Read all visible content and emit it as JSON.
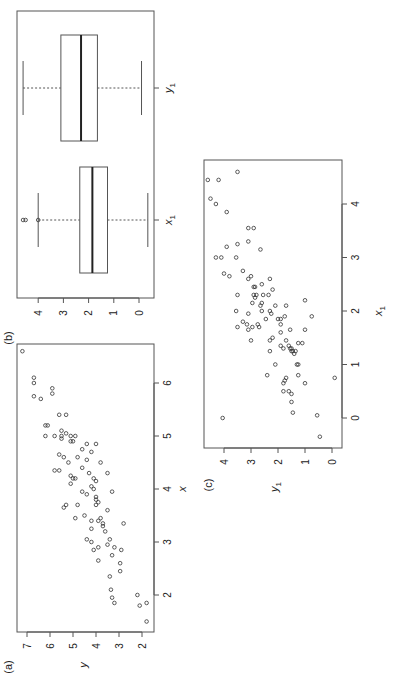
{
  "chart_data": [
    {
      "panel_label": "(a)",
      "type": "scatter",
      "title": "",
      "xlabel": "x",
      "ylabel": "y",
      "xticks": [
        2,
        3,
        4,
        5,
        6
      ],
      "yticks": [
        2,
        3,
        4,
        5,
        6,
        7
      ],
      "xlim": [
        1.5,
        6.7
      ],
      "ylim": [
        1.7,
        7.3
      ],
      "orientation": "rotated 90 degrees counter-clockwise",
      "points": [
        [
          6.6,
          7.2
        ],
        [
          6.1,
          6.7
        ],
        [
          6.0,
          6.7
        ],
        [
          5.9,
          5.9
        ],
        [
          5.8,
          5.9
        ],
        [
          5.75,
          6.7
        ],
        [
          5.7,
          6.4
        ],
        [
          5.4,
          5.6
        ],
        [
          5.4,
          5.3
        ],
        [
          5.2,
          6.1
        ],
        [
          5.2,
          6.2
        ],
        [
          5.1,
          5.5
        ],
        [
          5.05,
          5.3
        ],
        [
          5.0,
          5.5
        ],
        [
          5.0,
          6.2
        ],
        [
          5.0,
          5.8
        ],
        [
          5.0,
          5.1
        ],
        [
          5.0,
          4.9
        ],
        [
          4.95,
          5.5
        ],
        [
          4.9,
          5.1
        ],
        [
          4.9,
          5.0
        ],
        [
          4.85,
          4.4
        ],
        [
          4.85,
          4.0
        ],
        [
          4.75,
          4.6
        ],
        [
          4.7,
          4.2
        ],
        [
          4.65,
          5.6
        ],
        [
          4.6,
          5.4
        ],
        [
          4.6,
          4.8
        ],
        [
          4.55,
          4.4
        ],
        [
          4.5,
          5.2
        ],
        [
          4.5,
          3.8
        ],
        [
          4.4,
          4.6
        ],
        [
          4.35,
          5.8
        ],
        [
          4.35,
          5.6
        ],
        [
          4.3,
          4.3
        ],
        [
          4.3,
          3.5
        ],
        [
          4.25,
          5.1
        ],
        [
          4.2,
          5.0
        ],
        [
          4.2,
          4.9
        ],
        [
          4.2,
          4.1
        ],
        [
          4.15,
          4.0
        ],
        [
          4.1,
          5.1
        ],
        [
          4.05,
          4.2
        ],
        [
          4.0,
          4.1
        ],
        [
          3.95,
          4.6
        ],
        [
          3.95,
          3.3
        ],
        [
          3.9,
          4.4
        ],
        [
          3.85,
          4.0
        ],
        [
          3.8,
          4.0
        ],
        [
          3.75,
          3.9
        ],
        [
          3.7,
          5.3
        ],
        [
          3.7,
          4.8
        ],
        [
          3.7,
          4.0
        ],
        [
          3.65,
          5.4
        ],
        [
          3.6,
          3.5
        ],
        [
          3.5,
          4.5
        ],
        [
          3.45,
          4.9
        ],
        [
          3.45,
          3.8
        ],
        [
          3.4,
          4.2
        ],
        [
          3.4,
          3.9
        ],
        [
          3.35,
          3.7
        ],
        [
          3.35,
          2.8
        ],
        [
          3.3,
          3.7
        ],
        [
          3.25,
          4.2
        ],
        [
          3.2,
          3.6
        ],
        [
          3.05,
          4.4
        ],
        [
          3.05,
          3.4
        ],
        [
          3.0,
          4.2
        ],
        [
          2.95,
          3.5
        ],
        [
          2.9,
          3.9
        ],
        [
          2.9,
          3.2
        ],
        [
          2.85,
          4.1
        ],
        [
          2.85,
          2.9
        ],
        [
          2.75,
          3.3
        ],
        [
          2.65,
          3.9
        ],
        [
          2.6,
          2.95
        ],
        [
          2.45,
          2.95
        ],
        [
          2.35,
          3.4
        ],
        [
          2.1,
          3.35
        ],
        [
          1.95,
          3.3
        ],
        [
          1.85,
          3.2
        ],
        [
          2.0,
          2.2
        ],
        [
          1.8,
          2.1
        ],
        [
          1.85,
          1.8
        ],
        [
          1.5,
          1.8
        ]
      ]
    },
    {
      "panel_label": "(b)",
      "type": "boxplot",
      "title": "",
      "categories": [
        "x1",
        "y1"
      ],
      "yticks": [
        0,
        1,
        2,
        3,
        4
      ],
      "ylim": [
        -0.55,
        5.0
      ],
      "orientation": "rotated 90 degrees counter-clockwise",
      "series": [
        {
          "name": "x1",
          "whisker_low": -0.35,
          "q1": 1.25,
          "median": 1.85,
          "q3": 2.35,
          "whisker_high": 4.0,
          "outliers": [
            4.0,
            4.5,
            4.6
          ]
        },
        {
          "name": "y1",
          "whisker_low": -0.1,
          "q1": 1.65,
          "median": 2.3,
          "q3": 3.1,
          "whisker_high": 4.6,
          "outliers": []
        }
      ]
    },
    {
      "panel_label": "(c)",
      "type": "scatter",
      "title": "",
      "xlabel": "x1",
      "ylabel": "y1",
      "xticks": [
        0,
        1,
        2,
        3,
        4
      ],
      "yticks": [
        0,
        1,
        2,
        3,
        4
      ],
      "xlim": [
        -0.55,
        4.8
      ],
      "ylim": [
        -0.2,
        4.7
      ],
      "orientation": "rotated 90 degrees counter-clockwise",
      "points": [
        [
          4.6,
          3.5
        ],
        [
          4.45,
          4.6
        ],
        [
          4.45,
          4.2
        ],
        [
          4.1,
          4.5
        ],
        [
          4.0,
          4.3
        ],
        [
          3.85,
          3.9
        ],
        [
          3.55,
          3.1
        ],
        [
          3.55,
          2.9
        ],
        [
          3.3,
          3.1
        ],
        [
          3.25,
          3.5
        ],
        [
          3.2,
          3.9
        ],
        [
          3.15,
          2.65
        ],
        [
          3.0,
          4.3
        ],
        [
          3.0,
          4.1
        ],
        [
          3.0,
          3.55
        ],
        [
          2.75,
          3.3
        ],
        [
          2.7,
          4.0
        ],
        [
          2.65,
          3.8
        ],
        [
          2.65,
          3.0
        ],
        [
          2.6,
          3.1
        ],
        [
          2.6,
          2.3
        ],
        [
          2.5,
          2.6
        ],
        [
          2.45,
          2.9
        ],
        [
          2.45,
          2.85
        ],
        [
          2.4,
          2.2
        ],
        [
          2.3,
          2.9
        ],
        [
          2.3,
          2.8
        ],
        [
          2.3,
          2.55
        ],
        [
          2.3,
          2.35
        ],
        [
          2.3,
          3.5
        ],
        [
          2.25,
          2.85
        ],
        [
          2.2,
          1.0
        ],
        [
          2.15,
          2.95
        ],
        [
          2.15,
          2.6
        ],
        [
          2.1,
          2.65
        ],
        [
          2.1,
          2.1
        ],
        [
          2.1,
          1.7
        ],
        [
          2.0,
          3.55
        ],
        [
          2.0,
          2.6
        ],
        [
          2.0,
          2.3
        ],
        [
          1.95,
          3.1
        ],
        [
          1.95,
          2.25
        ],
        [
          1.9,
          1.75
        ],
        [
          1.9,
          0.75
        ],
        [
          1.85,
          2.45
        ],
        [
          1.85,
          1.9
        ],
        [
          1.85,
          2.0
        ],
        [
          1.8,
          3.3
        ],
        [
          1.75,
          3.15
        ],
        [
          1.75,
          2.75
        ],
        [
          1.75,
          1.9
        ],
        [
          1.7,
          3.5
        ],
        [
          1.7,
          2.95
        ],
        [
          1.7,
          2.7
        ],
        [
          1.65,
          3.1
        ],
        [
          1.65,
          1.55
        ],
        [
          1.65,
          1.0
        ],
        [
          1.6,
          1.9
        ],
        [
          1.5,
          2.2
        ],
        [
          1.45,
          3.0
        ],
        [
          1.45,
          2.3
        ],
        [
          1.45,
          1.7
        ],
        [
          1.4,
          1.25
        ],
        [
          1.4,
          1.1
        ],
        [
          1.35,
          1.9
        ],
        [
          1.35,
          1.6
        ],
        [
          1.3,
          1.8
        ],
        [
          1.3,
          1.55
        ],
        [
          1.3,
          1.5
        ],
        [
          1.25,
          1.5
        ],
        [
          1.25,
          2.3
        ],
        [
          1.25,
          1.45
        ],
        [
          1.25,
          1.35
        ],
        [
          1.2,
          1.4
        ],
        [
          1.0,
          2.1
        ],
        [
          1.0,
          1.3
        ],
        [
          1.0,
          1.25
        ],
        [
          0.8,
          2.4
        ],
        [
          0.8,
          1.25
        ],
        [
          0.75,
          1.7
        ],
        [
          0.75,
          -0.1
        ],
        [
          0.7,
          1.75
        ],
        [
          0.65,
          1.0
        ],
        [
          0.65,
          1.8
        ],
        [
          0.5,
          1.8
        ],
        [
          0.5,
          1.6
        ],
        [
          0.45,
          1.5
        ],
        [
          0.3,
          1.5
        ],
        [
          0.1,
          1.45
        ],
        [
          0.0,
          4.05
        ],
        [
          0.05,
          0.55
        ],
        [
          -0.35,
          0.45
        ]
      ]
    }
  ],
  "labels": {
    "a_panel": "(a)",
    "a_x": "x",
    "a_y": "y",
    "b_panel": "(b)",
    "b_cat1": "x",
    "b_cat1_sub": "1",
    "b_cat2": "y",
    "b_cat2_sub": "1",
    "c_panel": "(c)",
    "c_x": "x",
    "c_x_sub": "1",
    "c_y": "y",
    "c_y_sub": "1"
  }
}
